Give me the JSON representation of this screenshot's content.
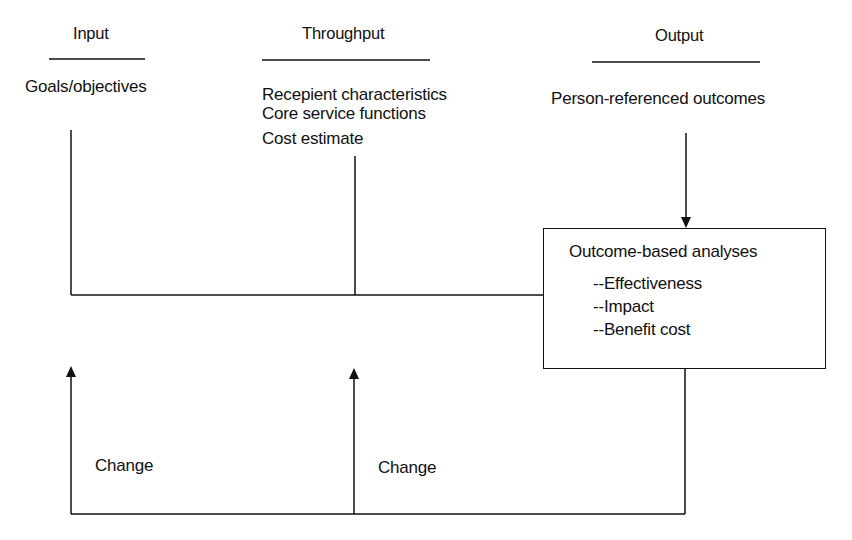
{
  "diagram": {
    "columns": [
      {
        "header": "Input",
        "items": [
          "Goals/objectives"
        ]
      },
      {
        "header": "Throughput",
        "items": [
          "Recepient characteristics",
          "Core service functions",
          "Cost estimate"
        ]
      },
      {
        "header": "Output",
        "items": [
          "Person-referenced outcomes"
        ]
      }
    ],
    "analysis_box": {
      "title": "Outcome-based analyses",
      "items": [
        "--Effectiveness",
        "--Impact",
        "--Benefit cost"
      ]
    },
    "feedback_labels": [
      "Change",
      "Change"
    ],
    "line_color": "#111111"
  }
}
